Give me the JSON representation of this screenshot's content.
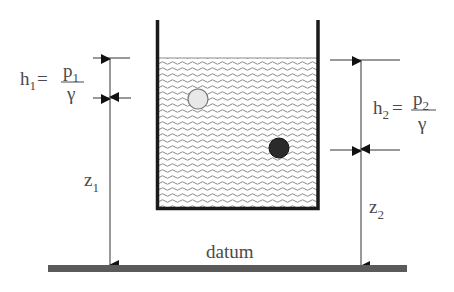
{
  "labels": {
    "h1": "h",
    "h1_sub": "1",
    "h1_eq": "=",
    "p1": "p",
    "p1_sub": "1",
    "gamma1": "γ",
    "h2": "h",
    "h2_sub": "2",
    "h2_eq": "=",
    "p2": "p",
    "p2_sub": "2",
    "gamma2": "γ",
    "z1": "z",
    "z1_sub": "1",
    "z2": "z",
    "z2_sub": "2",
    "datum": "datum"
  },
  "colors": {
    "wall": "#1a1a1a",
    "water_wave": "#8a8a8a",
    "datum_bar": "#5a5a5a",
    "dim_line": "#333333",
    "light_particle": "#e8e8e8",
    "dark_particle": "#2a2a2a"
  }
}
